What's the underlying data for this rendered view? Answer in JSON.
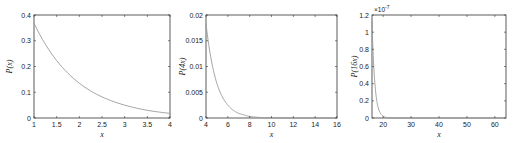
{
  "chart_data": [
    {
      "type": "line",
      "title": "",
      "xlabel": "x",
      "ylabel": "P(x)",
      "xlim": [
        1,
        4
      ],
      "ylim": [
        0,
        0.4
      ],
      "xticks": [
        "1",
        "1.5",
        "2",
        "2.5",
        "3",
        "3.5",
        "4"
      ],
      "yticks": [
        "0",
        "0.1",
        "0.2",
        "0.3",
        "0.4"
      ],
      "grid": false,
      "series": [
        {
          "name": "P(x)",
          "x": [
            1,
            1.5,
            2,
            2.5,
            3,
            3.5,
            4
          ],
          "values": [
            0.368,
            0.223,
            0.135,
            0.082,
            0.05,
            0.03,
            0.018
          ]
        }
      ]
    },
    {
      "type": "line",
      "title": "",
      "xlabel": "x",
      "ylabel": "P(4x)",
      "xlim": [
        4,
        16
      ],
      "ylim": [
        0,
        0.02
      ],
      "xticks": [
        "4",
        "6",
        "8",
        "10",
        "12",
        "14",
        "16"
      ],
      "yticks": [
        "0",
        "0.005",
        "0.01",
        "0.015",
        "0.02"
      ],
      "grid": false,
      "series": [
        {
          "name": "P(4x)",
          "x": [
            4,
            4.5,
            5,
            5.5,
            6,
            6.5,
            7,
            7.5,
            8,
            9,
            10,
            12,
            16
          ],
          "values": [
            0.0183,
            0.0111,
            0.0067,
            0.0041,
            0.0025,
            0.0015,
            0.0009,
            0.0006,
            0.0003,
            0.0001,
            5e-05,
            0,
            0
          ]
        }
      ]
    },
    {
      "type": "line",
      "title": "",
      "xlabel": "x",
      "ylabel": "P(16x)",
      "xlim": [
        16,
        64
      ],
      "ylim": [
        0,
        1.2e-07
      ],
      "y_exponent_label": "×10^-7",
      "xticks": [
        "20",
        "30",
        "40",
        "50",
        "60"
      ],
      "yticks": [
        "0",
        "0.2",
        "0.4",
        "0.6",
        "0.8",
        "1",
        "1.2"
      ],
      "grid": false,
      "series": [
        {
          "name": "P(16x)",
          "x": [
            16,
            16.5,
            17,
            17.5,
            18,
            19,
            20,
            21,
            22,
            25,
            64
          ],
          "values": [
            1.13e-07,
            6.8e-08,
            4.2e-08,
            2.5e-08,
            1.5e-08,
            5.6e-09,
            2.1e-09,
            7.6e-10,
            2.8e-10,
            0,
            0
          ]
        }
      ]
    }
  ],
  "labels": {
    "p1_ylabel_main": "P",
    "p1_ylabel_arg": "(x)",
    "p2_ylabel_main": "P",
    "p2_ylabel_arg": "(4x)",
    "p3_ylabel_main": "P",
    "p3_ylabel_arg": "(16x)",
    "xlabel": "x",
    "exp_base": "×10",
    "exp_power": "-7"
  },
  "colors": {
    "curve": "#9a9a9a",
    "axes": "#333333",
    "background": "#ffffff"
  }
}
